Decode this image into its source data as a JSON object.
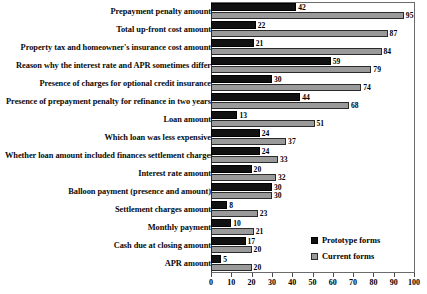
{
  "chart_data": {
    "type": "bar",
    "orientation": "horizontal",
    "title": "",
    "xlabel": "",
    "ylabel": "",
    "xlim": [
      0,
      100
    ],
    "xticks": [
      0,
      10,
      20,
      30,
      40,
      50,
      60,
      70,
      80,
      90,
      100
    ],
    "grid": false,
    "legend_position": "inside-bottom-right",
    "categories": [
      "Prepayment penalty amount",
      "Total up-front cost amount",
      "Property tax and homeowner's insurance cost amount",
      "Reason why the interest rate and APR sometimes differ",
      "Presence of charges for optional credit insurance",
      "Presence of prepayment penalty for refinance in two years",
      "Loan amount",
      "Which loan was less expensive",
      "Whether loan amount included finances settlement charges",
      "Interest rate amount",
      "Balloon payment (presence and amount)",
      "Settlement charges amount",
      "Monthly payment",
      "Cash due at closing amount",
      "APR amount"
    ],
    "series": [
      {
        "name": "Prototype forms",
        "color": "#111111",
        "values": [
          42,
          22,
          21,
          59,
          30,
          44,
          13,
          24,
          24,
          20,
          30,
          8,
          10,
          17,
          5
        ]
      },
      {
        "name": "Current forms",
        "color": "#9a9a9a",
        "values": [
          95,
          87,
          84,
          79,
          74,
          68,
          51,
          37,
          33,
          32,
          30,
          23,
          21,
          20,
          20
        ]
      }
    ]
  },
  "legend": {
    "entries": [
      {
        "label": "Prototype forms"
      },
      {
        "label": "Current forms"
      }
    ]
  }
}
